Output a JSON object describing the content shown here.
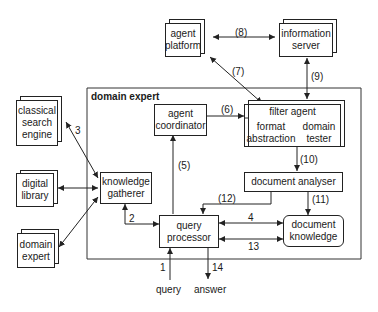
{
  "diagram": {
    "container_label": "domain expert",
    "nodes": {
      "agent_platform": [
        "agent",
        "platform"
      ],
      "information_server": [
        "information",
        "server"
      ],
      "classical_search_engine": [
        "classical",
        "search",
        "engine"
      ],
      "digital_library": [
        "digital",
        "library"
      ],
      "domain_expert_ext": [
        "domain",
        "expert"
      ],
      "agent_coordinator": [
        "agent",
        "coordinator"
      ],
      "filter_agent": "filter agent",
      "format_abstraction": [
        "format",
        "abstraction"
      ],
      "domain_tester": [
        "domain",
        "tester"
      ],
      "knowledge_gatherer": [
        "knowledge",
        "gatherer"
      ],
      "document_analyser": "document analyser",
      "query_processor": [
        "query",
        "processor"
      ],
      "document_knowledge": [
        "document",
        "knowledge"
      ]
    },
    "edge_labels": {
      "e1": "1",
      "e2": "2",
      "e3": "3",
      "e4": "4",
      "e5": "(5)",
      "e6": "(6)",
      "e7": "(7)",
      "e8": "(8)",
      "e9": "(9)",
      "e10": "(10)",
      "e11": "(11)",
      "e12": "(12)",
      "e13": "13",
      "e14": "14"
    },
    "io": {
      "query": "query",
      "answer": "answer"
    }
  }
}
